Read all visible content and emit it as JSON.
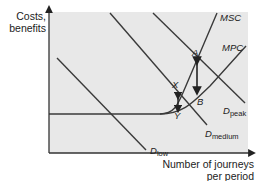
{
  "diagram": {
    "y_axis_label_line1": "Costs,",
    "y_axis_label_line2": "benefits",
    "x_axis_label_line1": "Number of journeys",
    "x_axis_label_line2": "per period",
    "curves": {
      "msc": "MSC",
      "mpc": "MPC",
      "d_low_main": "D",
      "d_low_sub": "low",
      "d_medium_main": "D",
      "d_medium_sub": "medium",
      "d_peak_main": "D",
      "d_peak_sub": "peak"
    },
    "points": {
      "a": "A",
      "b": "B",
      "x": "X",
      "y": "Y"
    },
    "colors": {
      "plot_background": "#e8e8e8",
      "line": "#3a3a3a",
      "text": "#222222"
    }
  }
}
